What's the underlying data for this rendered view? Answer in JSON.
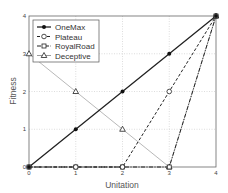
{
  "chart_data": {
    "type": "line",
    "title": "",
    "xlabel": "Unitation",
    "ylabel": "Fitness",
    "x": [
      0,
      1,
      2,
      3,
      4
    ],
    "xlim": [
      0,
      4
    ],
    "ylim": [
      0,
      4
    ],
    "xticks": [
      "0",
      "1",
      "2",
      "3",
      "4"
    ],
    "yticks": [
      "0",
      "1",
      "2",
      "3",
      "4"
    ],
    "grid": true,
    "legend_position": "upper left",
    "series": [
      {
        "name": "OneMax",
        "values": [
          0,
          1,
          2,
          3,
          4
        ],
        "style": "solid",
        "marker": "filled-circle"
      },
      {
        "name": "Plateau",
        "values": [
          0,
          0,
          0,
          2,
          4
        ],
        "style": "dashed",
        "marker": "open-circle"
      },
      {
        "name": "RoyalRoad",
        "values": [
          0,
          0,
          0,
          0,
          4
        ],
        "style": "dash-dot",
        "marker": "open-square"
      },
      {
        "name": "Deceptive",
        "values": [
          3,
          2,
          1,
          0,
          4
        ],
        "style": "dotted",
        "marker": "triangle"
      }
    ]
  }
}
